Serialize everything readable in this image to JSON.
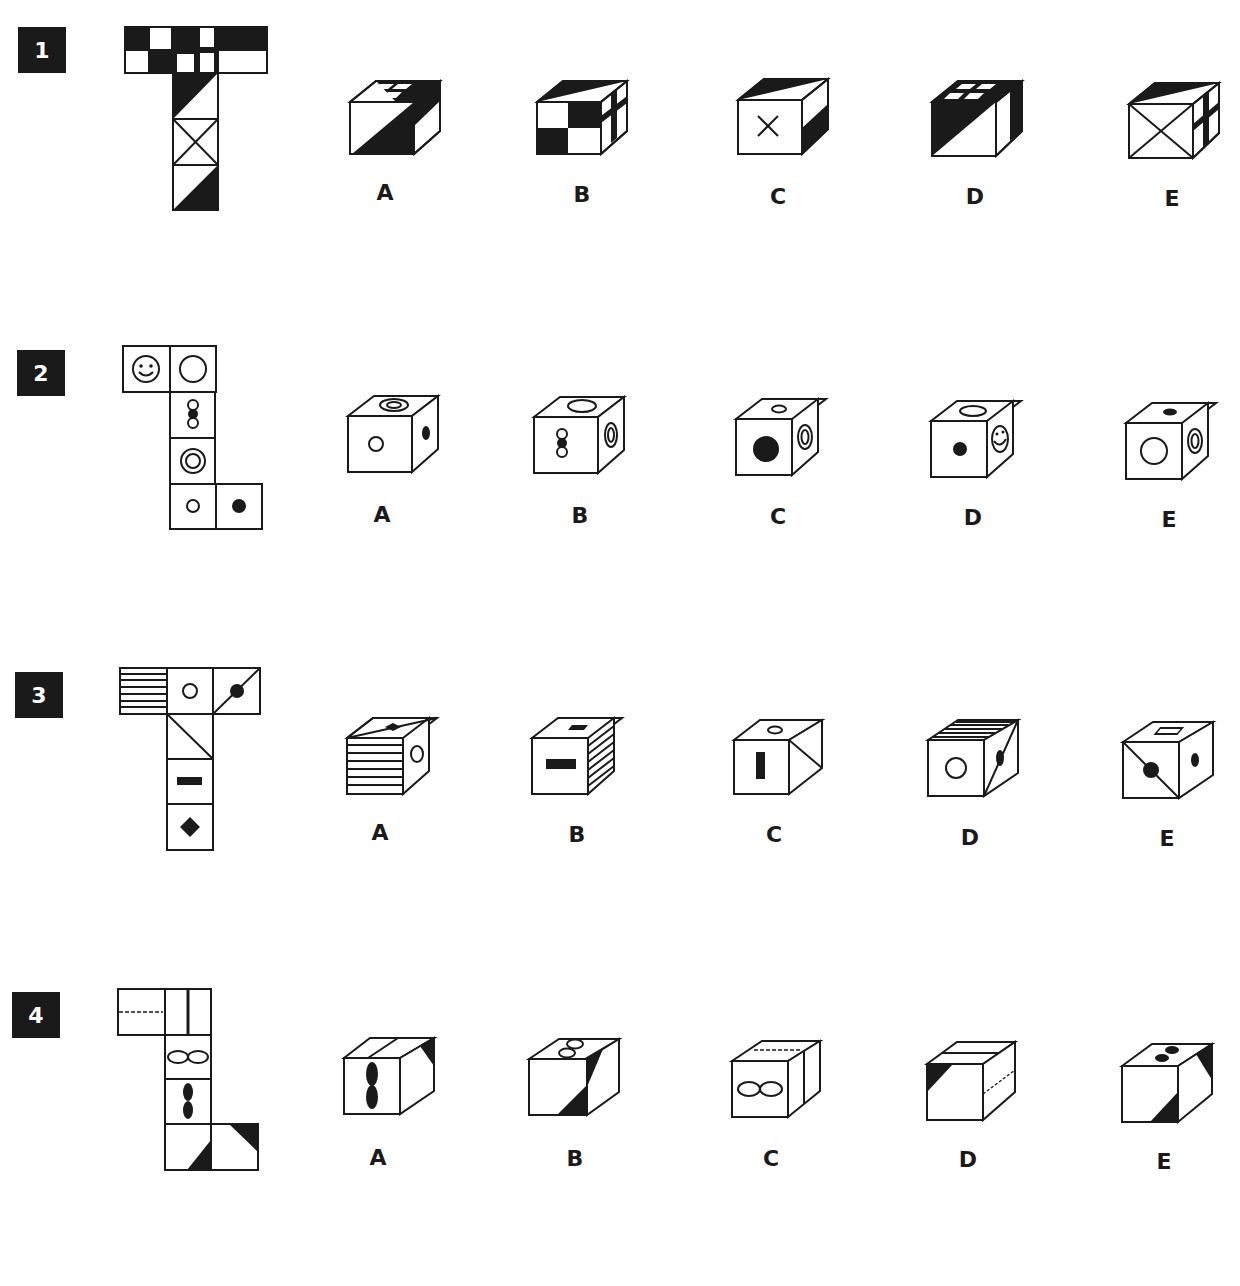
{
  "questions": [
    {
      "number": "1",
      "options": [
        "A",
        "B",
        "C",
        "D",
        "E"
      ]
    },
    {
      "number": "2",
      "options": [
        "A",
        "B",
        "C",
        "D",
        "E"
      ]
    },
    {
      "number": "3",
      "options": [
        "A",
        "B",
        "C",
        "D",
        "E"
      ]
    },
    {
      "number": "4",
      "options": [
        "A",
        "B",
        "C",
        "D",
        "E"
      ]
    }
  ],
  "colors": {
    "ink": "#1a1a1a",
    "paper": "#ffffff"
  }
}
